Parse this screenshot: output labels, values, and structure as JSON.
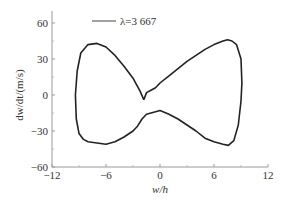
{
  "chart_data": {
    "type": "line",
    "title": "",
    "xlabel": "w/h",
    "ylabel": "dw/dt/(m/s)",
    "xlim": [
      -12,
      12
    ],
    "ylim": [
      -60,
      70
    ],
    "xticks": [
      -12,
      -6,
      0,
      6,
      12
    ],
    "yticks": [
      -60,
      -30,
      0,
      30,
      60
    ],
    "xtick_labels": [
      "−12",
      "−6",
      "0",
      "6",
      "12"
    ],
    "ytick_labels": [
      "−60",
      "−30",
      "0",
      "30",
      "60"
    ],
    "grid": false,
    "legend": {
      "position": "upper-center",
      "entries": [
        "λ=3 667"
      ]
    },
    "series": [
      {
        "name": "λ=3 667",
        "color": "#222222",
        "x": [
          -1.8,
          -2.2,
          -3.0,
          -4.0,
          -5.0,
          -6.0,
          -7.0,
          -8.0,
          -8.8,
          -9.2,
          -9.4,
          -9.3,
          -9.0,
          -8.5,
          -8.0,
          -7.0,
          -6.0,
          -5.0,
          -4.0,
          -3.0,
          -2.5,
          -2.0,
          -1.5,
          -1.0,
          0.0,
          1.0,
          2.0,
          3.0,
          4.0,
          5.0,
          6.0,
          7.0,
          7.6,
          8.2,
          8.7,
          9.0,
          9.1,
          9.0,
          8.5,
          8.0,
          7.5,
          7.0,
          6.0,
          5.0,
          4.0,
          3.0,
          2.0,
          1.0,
          0.0,
          -0.5,
          -1.0,
          -1.5,
          -1.8
        ],
        "y": [
          -4,
          3,
          14,
          24,
          33,
          40,
          43,
          42,
          35,
          20,
          0,
          -20,
          -32,
          -37,
          -39,
          -40,
          -41,
          -39,
          -35,
          -30,
          -26,
          -20,
          -16,
          -15,
          -13,
          -16,
          -20,
          -25,
          -30,
          -36,
          -39,
          -41,
          -42,
          -38,
          -25,
          -5,
          10,
          30,
          42,
          45,
          46,
          45,
          42,
          38,
          33,
          28,
          22,
          16,
          10,
          6,
          4,
          2,
          -4
        ]
      }
    ]
  }
}
